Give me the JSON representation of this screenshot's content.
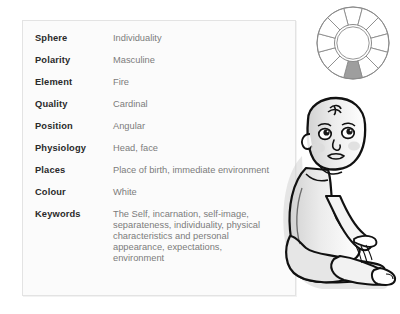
{
  "panel": {
    "title": "Sun attributes table",
    "rows": [
      {
        "label": "Sphere",
        "value": "Individuality"
      },
      {
        "label": "Polarity",
        "value": "Masculine"
      },
      {
        "label": "Element",
        "value": "Fire"
      },
      {
        "label": "Quality",
        "value": "Cardinal"
      },
      {
        "label": "Position",
        "value": "Angular"
      },
      {
        "label": "Physiology",
        "value": "Head, face"
      },
      {
        "label": "Places",
        "value": "Place of birth, immediate environment"
      },
      {
        "label": "Colour",
        "value": "White"
      }
    ],
    "keywords": {
      "label": "Keywords",
      "lines": [
        "The Self, incarnation, self-image,",
        "separateness, individuality, physical",
        "characteristics and personal",
        "appearance, expectations,",
        "environment"
      ]
    }
  },
  "wheel": {
    "name": "zodiac-wheel",
    "segments": 12,
    "highlighted_segment_index": 6,
    "highlight_color": "#9e9e9e",
    "line_color": "#8a8a8a",
    "fill_color": "#ffffff"
  },
  "illustration": {
    "name": "seated-baby",
    "description": "Seated infant line illustration",
    "outline_color": "#111111",
    "shade_color": "#d7d7d7",
    "skin_color": "#ffffff"
  },
  "colors": {
    "page_background": "#ffffff",
    "panel_background": "#fbfbfb",
    "panel_border": "#e3e3e3",
    "label_text": "#2a2a2a",
    "value_text": "#7c7c7c"
  }
}
